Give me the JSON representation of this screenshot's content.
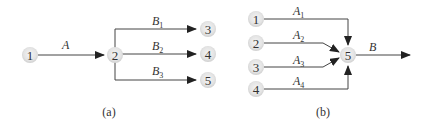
{
  "diagram_a": {
    "caption": "(a)",
    "nodes": [
      {
        "id": "1",
        "label": "1"
      },
      {
        "id": "2",
        "label": "2"
      },
      {
        "id": "3",
        "label": "3"
      },
      {
        "id": "4",
        "label": "4"
      },
      {
        "id": "5",
        "label": "5"
      }
    ],
    "edges": [
      {
        "from": "1",
        "to": "2",
        "label": "A",
        "sub": ""
      },
      {
        "from": "2",
        "to": "3",
        "label": "B",
        "sub": "1"
      },
      {
        "from": "2",
        "to": "4",
        "label": "B",
        "sub": "2"
      },
      {
        "from": "2",
        "to": "5",
        "label": "B",
        "sub": "3"
      }
    ]
  },
  "diagram_b": {
    "caption": "(b)",
    "nodes": [
      {
        "id": "1",
        "label": "1"
      },
      {
        "id": "2",
        "label": "2"
      },
      {
        "id": "3",
        "label": "3"
      },
      {
        "id": "4",
        "label": "4"
      },
      {
        "id": "5",
        "label": "5"
      }
    ],
    "edges": [
      {
        "from": "1",
        "to": "5",
        "label": "A",
        "sub": "1"
      },
      {
        "from": "2",
        "to": "5",
        "label": "A",
        "sub": "2"
      },
      {
        "from": "3",
        "to": "5",
        "label": "A",
        "sub": "3"
      },
      {
        "from": "4",
        "to": "5",
        "label": "A",
        "sub": "4"
      },
      {
        "from": "5",
        "to": "out",
        "label": "B",
        "sub": ""
      }
    ]
  }
}
